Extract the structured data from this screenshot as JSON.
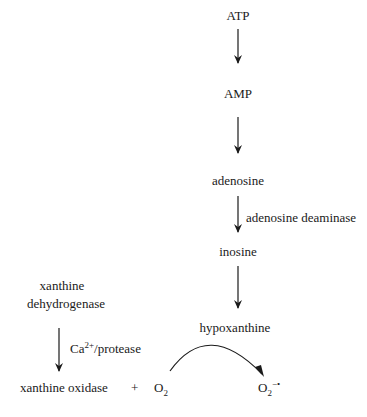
{
  "diagram": {
    "type": "biochemical-pathway",
    "nodes": {
      "atp": "ATP",
      "amp": "AMP",
      "adenosine": "adenosine",
      "inosine": "inosine",
      "hypoxanthine": "hypoxanthine",
      "xanthine_dehydrogenase_line1": "xanthine",
      "xanthine_dehydrogenase_line2": "dehydrogenase",
      "xanthine_oxidase": "xanthine oxidase",
      "plus": "+",
      "oxygen_base": "O",
      "oxygen_sub": "2",
      "superoxide_base": "O",
      "superoxide_sub": "2",
      "superoxide_sup": "−•"
    },
    "edge_labels": {
      "adenosine_deaminase": "adenosine deaminase",
      "calcium_base": "Ca",
      "calcium_sup": "2+",
      "protease_suffix": "/protease"
    },
    "edges": [
      {
        "from": "ATP",
        "to": "AMP"
      },
      {
        "from": "AMP",
        "to": "adenosine"
      },
      {
        "from": "adenosine",
        "to": "inosine",
        "label": "adenosine deaminase"
      },
      {
        "from": "inosine",
        "to": "hypoxanthine"
      },
      {
        "from": "xanthine dehydrogenase",
        "to": "xanthine oxidase",
        "label": "Ca2+/protease"
      },
      {
        "from": "O2",
        "to": "O2−•",
        "label": "hypoxanthine",
        "shape": "curved"
      }
    ],
    "colors": {
      "ink": "#1a1a1a",
      "background": "#ffffff"
    }
  }
}
